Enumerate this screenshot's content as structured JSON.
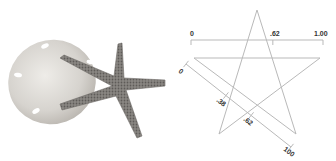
{
  "photo": {
    "subject": "sand dollar with starfish",
    "colors": {
      "sand_dollar": "#d9d6d0",
      "starfish": "#8a8783",
      "starfish_dark": "#5e5b58"
    }
  },
  "diagram": {
    "line_color": "#b9b9b9",
    "horizontal_ruler": {
      "labels": [
        {
          "text": "0",
          "value": 0
        },
        {
          "text": ".62",
          "value": 0.62
        },
        {
          "text": "1.00",
          "value": 1.0
        }
      ]
    },
    "diagonal_ruler": {
      "labels": [
        {
          "text": "0",
          "value": 0
        },
        {
          "text": ".38",
          "value": 0.38
        },
        {
          "text": ".62",
          "value": 0.62
        },
        {
          "text": "100",
          "value": 1.0
        }
      ]
    }
  }
}
